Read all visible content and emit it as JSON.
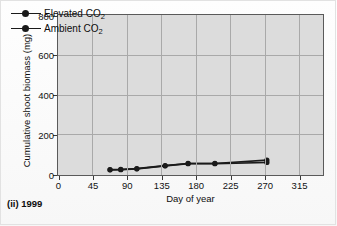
{
  "figure": {
    "caption": "(ii) 1999",
    "background_color": "#dcdcdc",
    "frame_color": "#5a5a5a",
    "grid_color": "#a9a9a9",
    "series_color": "#1a1a1a"
  },
  "chart_data": {
    "type": "line",
    "title": "",
    "subtitle": "(ii) 1999",
    "xlabel": "Day of year",
    "ylabel": "Cumulative shoot biomass (mg)",
    "xlim": [
      0,
      345
    ],
    "ylim": [
      0,
      800
    ],
    "xticks": [
      0,
      45,
      90,
      135,
      180,
      225,
      270,
      315
    ],
    "yticks": [
      0,
      200,
      400,
      600,
      800
    ],
    "xticklabels": [
      "0",
      "45",
      "90",
      "135",
      "180",
      "225",
      "270",
      "315"
    ],
    "yticklabels": [
      "0",
      "200",
      "400",
      "600",
      "800"
    ],
    "grid": true,
    "grid_axes": "both",
    "legend_position": "upper left",
    "series": [
      {
        "name": "Elevated CO2",
        "label_html": "Elevated CO<sub>2</sub>",
        "marker": "filled-circle",
        "color": "#1a1a1a",
        "x": [
          68,
          82,
          103,
          140,
          170,
          205,
          273
        ],
        "y": [
          22,
          23,
          27,
          42,
          53,
          53,
          70
        ]
      },
      {
        "name": "Ambient CO2",
        "label_html": "Ambient CO<sub>2</sub>",
        "marker": "filled-circle",
        "color": "#1a1a1a",
        "x": [
          68,
          82,
          103,
          140,
          170,
          205,
          273
        ],
        "y": [
          21,
          22,
          26,
          41,
          52,
          52,
          58
        ]
      }
    ]
  },
  "legend": {
    "items": [
      {
        "label": "Elevated CO",
        "sub": "2"
      },
      {
        "label": "Ambient CO",
        "sub": "2"
      }
    ]
  },
  "axis_titles": {
    "x": "Day of year",
    "y": "Cumulative shoot biomass (mg)"
  }
}
